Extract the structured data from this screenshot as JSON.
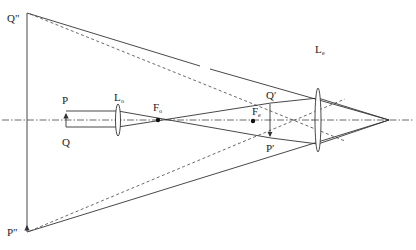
{
  "diagram": {
    "labels": {
      "q_double_prime": "Q\"",
      "p_double_prime": "P\"",
      "p": "P",
      "q": "Q",
      "lo_main": "L",
      "lo_sub": "o",
      "fo_main": "F",
      "fo_sub": "o",
      "fe_main": "F",
      "fe_sub": "e",
      "q_prime": "Q′",
      "p_prime": "P′",
      "le_main": "L",
      "le_sub": "e"
    },
    "elements": {
      "objective_lens": "Lo",
      "eyepiece_lens": "Le",
      "objective_focus": "Fo",
      "eyepiece_focus": "Fe",
      "intermediate_image": "Q′P′",
      "final_virtual_image": "Q\"P\""
    },
    "colors": {
      "line": "#333333",
      "background": "#ffffff"
    }
  }
}
